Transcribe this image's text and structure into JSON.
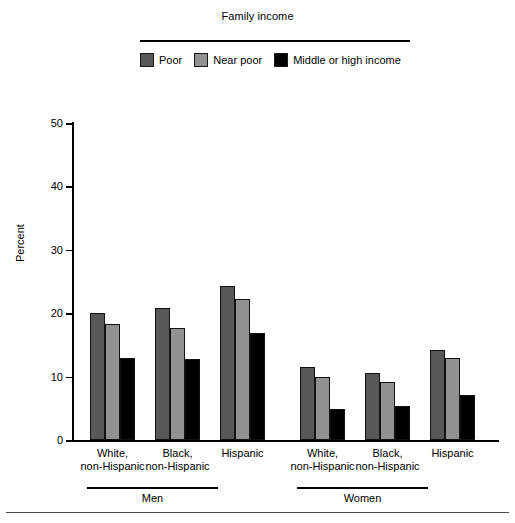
{
  "legend": {
    "title": "Family income",
    "items": [
      {
        "label": "Poor",
        "color": "#585858"
      },
      {
        "label": "Near poor",
        "color": "#919191"
      },
      {
        "label": "Middle or high income",
        "color": "#000000"
      }
    ]
  },
  "axis": {
    "y_title": "Percent",
    "y_ticks": [
      "0",
      "10",
      "20",
      "30",
      "40",
      "50"
    ]
  },
  "supergroups": [
    {
      "label": "Men"
    },
    {
      "label": "Women"
    }
  ],
  "categories": [
    "White,|non-Hispanic",
    "Black,|non-Hispanic",
    "Hispanic",
    "White,|non-Hispanic",
    "Black,|non-Hispanic",
    "Hispanic"
  ],
  "chart_data": {
    "type": "bar",
    "title": "",
    "legend_title": "Family income",
    "legend_position": "top",
    "xlabel": "",
    "ylabel": "Percent",
    "ylim": [
      0,
      50
    ],
    "yticks": [
      0,
      10,
      20,
      30,
      40,
      50
    ],
    "grid": false,
    "group_labels": [
      "Men",
      "Women"
    ],
    "categories": [
      "Men - White, non-Hispanic",
      "Men - Black, non-Hispanic",
      "Men - Hispanic",
      "Women - White, non-Hispanic",
      "Women - Black, non-Hispanic",
      "Women - Hispanic"
    ],
    "series": [
      {
        "name": "Poor",
        "color": "#585858",
        "values": [
          20.0,
          20.8,
          24.3,
          11.5,
          10.6,
          14.2
        ]
      },
      {
        "name": "Near poor",
        "color": "#919191",
        "values": [
          18.3,
          17.6,
          22.2,
          9.9,
          9.2,
          12.9
        ]
      },
      {
        "name": "Middle or high income",
        "color": "#000000",
        "values": [
          12.9,
          12.7,
          16.9,
          4.9,
          5.4,
          7.1
        ]
      }
    ]
  }
}
